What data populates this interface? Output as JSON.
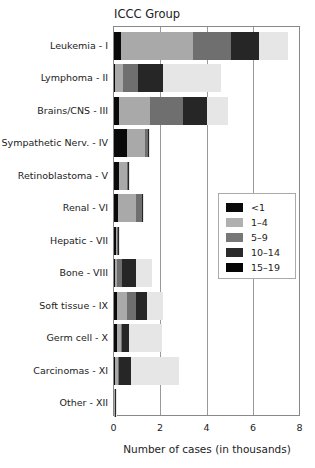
{
  "chart_data": {
    "type": "bar",
    "orientation": "horizontal",
    "stacked": true,
    "title": "ICCC Group",
    "xlabel": "Number of cases (in thousands)",
    "ylabel": "ICCC Group",
    "xlim": [
      0,
      8
    ],
    "xticks": [
      "0",
      "2",
      "4",
      "6",
      "8"
    ],
    "grid": true,
    "legend_position": "right-middle-inside",
    "categories": [
      "Leukemia - I",
      "Lymphoma - II",
      "Brains/CNS - III",
      "Sympathetic Nerv. - IV",
      "Retinoblastoma - V",
      "Renal - VI",
      "Hepatic - VII",
      "Bone - VIII",
      "Soft tissue - IX",
      "Germ cell - X",
      "Carcinomas - XI",
      "Other - XII"
    ],
    "series": [
      {
        "name": "<1",
        "color": "#0a0a0a",
        "values": [
          0.32,
          0.03,
          0.2,
          0.55,
          0.22,
          0.18,
          0.1,
          0.05,
          0.15,
          0.13,
          0.05,
          0.02
        ]
      },
      {
        "name": "1–4",
        "color": "#a9a9a9",
        "values": [
          3.07,
          0.35,
          1.35,
          0.8,
          0.35,
          0.78,
          0.05,
          0.1,
          0.4,
          0.17,
          0.13,
          0.02
        ]
      },
      {
        "name": "5–9",
        "color": "#6f6f6f",
        "values": [
          1.63,
          0.65,
          1.4,
          0.12,
          0.05,
          0.26,
          0.03,
          0.2,
          0.4,
          0.05,
          0.05,
          0.02
        ]
      },
      {
        "name": "10–14",
        "color": "#262626",
        "values": [
          1.2,
          1.1,
          1.05,
          0.05,
          0.02,
          0.04,
          0.04,
          0.6,
          0.45,
          0.3,
          0.5,
          0.01
        ]
      },
      {
        "name": "15–19",
        "color": "#e6e6e6",
        "values": [
          1.25,
          2.47,
          0.9,
          0.02,
          0.01,
          0.02,
          0.03,
          0.7,
          0.7,
          1.4,
          2.07,
          0.01
        ]
      }
    ]
  },
  "legend": {
    "items": [
      {
        "label": "<1",
        "color": "#0a0a0a"
      },
      {
        "label": "1–4",
        "color": "#b0b0b0"
      },
      {
        "label": "5–9",
        "color": "#777777"
      },
      {
        "label": "10–14",
        "color": "#2a2a2a"
      },
      {
        "label": "15–19",
        "color": "#050505"
      }
    ]
  }
}
